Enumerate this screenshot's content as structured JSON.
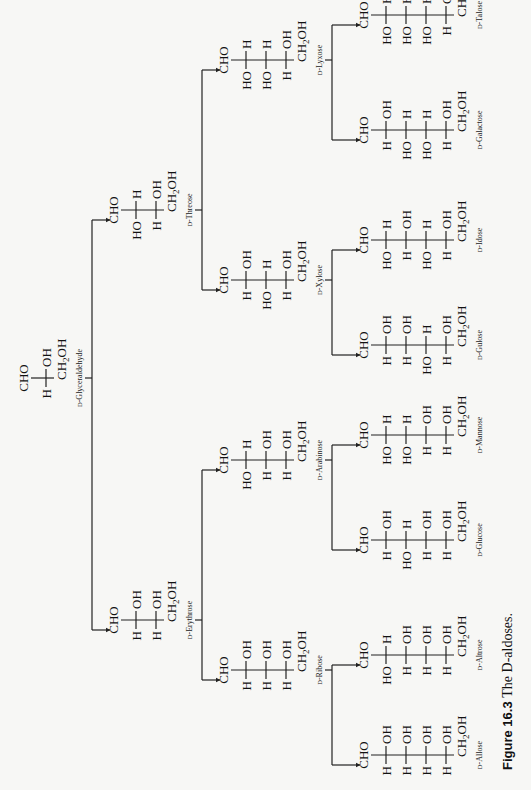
{
  "caption": {
    "figure_number": "Figure 16.3",
    "title": "The D-aldoses."
  },
  "layout": {
    "orientation": "rotated-90-ccw",
    "line_color": "#222222",
    "background": "#f7f7f5"
  },
  "sugars": [
    {
      "id": "glyceraldehyde",
      "name": "D-Glyceraldehyde",
      "carbons": 3,
      "x": 412,
      "y": 18,
      "rows": [
        [
          "H",
          "OH"
        ]
      ]
    },
    {
      "id": "erythrose",
      "name": "D-Erythrose",
      "carbons": 4,
      "x": 170,
      "y": 108,
      "rows": [
        [
          "H",
          "OH"
        ],
        [
          "H",
          "OH"
        ]
      ]
    },
    {
      "id": "threose",
      "name": "D-Threose",
      "carbons": 4,
      "x": 580,
      "y": 108,
      "rows": [
        [
          "HO",
          "H"
        ],
        [
          "H",
          "OH"
        ]
      ]
    },
    {
      "id": "ribose",
      "name": "D-Ribose",
      "carbons": 5,
      "x": 120,
      "y": 218,
      "rows": [
        [
          "H",
          "OH"
        ],
        [
          "H",
          "OH"
        ],
        [
          "H",
          "OH"
        ]
      ]
    },
    {
      "id": "arabinose",
      "name": "D-Arabinose",
      "carbons": 5,
      "x": 330,
      "y": 218,
      "rows": [
        [
          "HO",
          "H"
        ],
        [
          "H",
          "OH"
        ],
        [
          "H",
          "OH"
        ]
      ]
    },
    {
      "id": "xylose",
      "name": "D-Xylose",
      "carbons": 5,
      "x": 510,
      "y": 218,
      "rows": [
        [
          "H",
          "OH"
        ],
        [
          "HO",
          "H"
        ],
        [
          "H",
          "OH"
        ]
      ]
    },
    {
      "id": "lyxose",
      "name": "D-Lyxose",
      "carbons": 5,
      "x": 730,
      "y": 218,
      "rows": [
        [
          "HO",
          "H"
        ],
        [
          "HO",
          "H"
        ],
        [
          "H",
          "OH"
        ]
      ]
    },
    {
      "id": "allose",
      "name": "D-Allose",
      "carbons": 6,
      "x": 35,
      "y": 358,
      "rows": [
        [
          "H",
          "OH"
        ],
        [
          "H",
          "OH"
        ],
        [
          "H",
          "OH"
        ],
        [
          "H",
          "OH"
        ]
      ]
    },
    {
      "id": "altrose",
      "name": "D-Altrose",
      "carbons": 6,
      "x": 135,
      "y": 358,
      "rows": [
        [
          "HO",
          "H"
        ],
        [
          "H",
          "OH"
        ],
        [
          "H",
          "OH"
        ],
        [
          "H",
          "OH"
        ]
      ]
    },
    {
      "id": "glucose",
      "name": "D-Glucose",
      "carbons": 6,
      "x": 250,
      "y": 358,
      "rows": [
        [
          "H",
          "OH"
        ],
        [
          "HO",
          "H"
        ],
        [
          "H",
          "OH"
        ],
        [
          "H",
          "OH"
        ]
      ]
    },
    {
      "id": "mannose",
      "name": "D-Mannose",
      "carbons": 6,
      "x": 355,
      "y": 358,
      "rows": [
        [
          "HO",
          "H"
        ],
        [
          "HO",
          "H"
        ],
        [
          "H",
          "OH"
        ],
        [
          "H",
          "OH"
        ]
      ]
    },
    {
      "id": "gulose",
      "name": "D-Gulose",
      "carbons": 6,
      "x": 445,
      "y": 358,
      "rows": [
        [
          "H",
          "OH"
        ],
        [
          "H",
          "OH"
        ],
        [
          "HO",
          "H"
        ],
        [
          "H",
          "OH"
        ]
      ]
    },
    {
      "id": "idose",
      "name": "D-Idose",
      "carbons": 6,
      "x": 550,
      "y": 358,
      "rows": [
        [
          "HO",
          "H"
        ],
        [
          "H",
          "OH"
        ],
        [
          "HO",
          "H"
        ],
        [
          "H",
          "OH"
        ]
      ]
    },
    {
      "id": "galactose",
      "name": "D-Galactose",
      "carbons": 6,
      "x": 660,
      "y": 358,
      "rows": [
        [
          "H",
          "OH"
        ],
        [
          "HO",
          "H"
        ],
        [
          "HO",
          "H"
        ],
        [
          "H",
          "OH"
        ]
      ]
    },
    {
      "id": "talose",
      "name": "D-Talose",
      "carbons": 6,
      "x": 775,
      "y": 358,
      "rows": [
        [
          "HO",
          "H"
        ],
        [
          "HO",
          "H"
        ],
        [
          "HO",
          "H"
        ],
        [
          "H",
          "OH"
        ]
      ]
    }
  ],
  "tree": [
    {
      "parent": "glyceraldehyde",
      "children": [
        "erythrose",
        "threose"
      ]
    },
    {
      "parent": "erythrose",
      "children": [
        "ribose",
        "arabinose"
      ]
    },
    {
      "parent": "threose",
      "children": [
        "xylose",
        "lyxose"
      ]
    },
    {
      "parent": "ribose",
      "children": [
        "allose",
        "altrose"
      ]
    },
    {
      "parent": "arabinose",
      "children": [
        "glucose",
        "mannose"
      ]
    },
    {
      "parent": "xylose",
      "children": [
        "gulose",
        "idose"
      ]
    },
    {
      "parent": "lyxose",
      "children": [
        "galactose",
        "talose"
      ]
    }
  ],
  "group_labels": {
    "top": "CHO",
    "bottom": "CH2OH",
    "bottom_main": "CH",
    "bottom_sub": "2",
    "bottom_tail": "OH"
  }
}
